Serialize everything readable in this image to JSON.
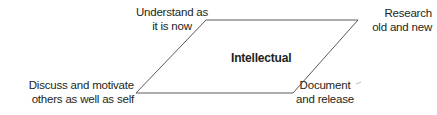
{
  "diagram": {
    "center_label": "Intellectual",
    "shape": "parallelogram",
    "line_color": "#5a5a5a",
    "text_color": "#231f20",
    "corners": {
      "top_left": {
        "line1": "Understand as",
        "line2": "it is now"
      },
      "top_right": {
        "line1": "Research",
        "line2": "old and new"
      },
      "bottom_left": {
        "line1": "Discuss and motivate",
        "line2": "others as well as self"
      },
      "bottom_right": {
        "line1": "Document",
        "line2": "and release"
      }
    }
  }
}
